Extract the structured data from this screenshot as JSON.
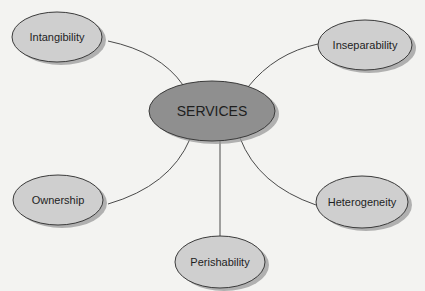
{
  "diagram": {
    "type": "concept-map",
    "center": {
      "label": "SERVICES",
      "cx": 212,
      "cy": 111,
      "rx": 63,
      "ry": 30,
      "fill": "#8f8f8f"
    },
    "nodes": [
      {
        "id": "intangibility",
        "label": "Intangibility",
        "cx": 57,
        "cy": 37,
        "rx": 45,
        "ry": 25
      },
      {
        "id": "inseparability",
        "label": "Inseparability",
        "cx": 365,
        "cy": 45,
        "rx": 47,
        "ry": 25
      },
      {
        "id": "ownership",
        "label": "Ownership",
        "cx": 58,
        "cy": 200,
        "rx": 45,
        "ry": 25
      },
      {
        "id": "heterogeneity",
        "label": "Heterogeneity",
        "cx": 362,
        "cy": 202,
        "rx": 46,
        "ry": 26
      },
      {
        "id": "perishability",
        "label": "Perishability",
        "cx": 220,
        "cy": 262,
        "rx": 45,
        "ry": 26
      }
    ],
    "edges": [
      {
        "to": "intangibility",
        "path": "M 183 85 Q 160 52 108 41"
      },
      {
        "to": "inseparability",
        "path": "M 248 87 Q 275 53 318 44"
      },
      {
        "to": "ownership",
        "path": "M 190 139 Q 170 186 108 204"
      },
      {
        "to": "heterogeneity",
        "path": "M 240 138 Q 258 185 316 205"
      },
      {
        "to": "perishability",
        "path": "M 220 141 L 220 236"
      }
    ],
    "colors": {
      "node_fill": "#cfcfcf",
      "center_fill": "#8f8f8f",
      "stroke": "#3a3a3a",
      "shadow": "#9a9a9a",
      "edge": "#4a4a4a",
      "background": "#f3f3f1"
    }
  }
}
